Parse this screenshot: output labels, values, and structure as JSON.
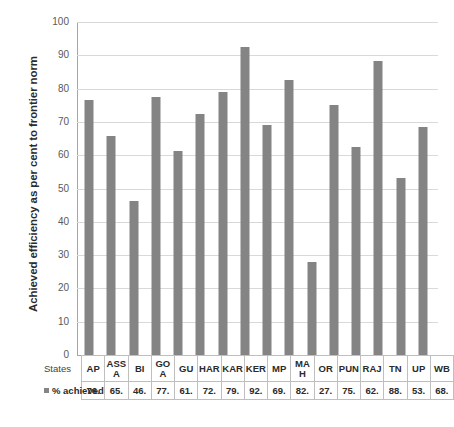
{
  "chart_data": {
    "type": "bar",
    "title": "",
    "xlabel": "States",
    "ylabel": "Achieved efficiency as per cent to frontier norm",
    "ylim": [
      0,
      100
    ],
    "ytick_step": 10,
    "yticks": [
      "100",
      "90",
      "80",
      "70",
      "60",
      "50",
      "40",
      "30",
      "20",
      "10",
      "0"
    ],
    "grid": true,
    "legend": "% achieved",
    "bar_color": "#848484",
    "gridline_color": "#d9d9d9",
    "axis_color": "#a6a6a6",
    "categories": [
      "AP",
      "ASS A",
      "BI",
      "GO A",
      "GU",
      "HAR",
      "KAR",
      "KER",
      "MP",
      "MA H",
      "OR",
      "PUN",
      "RAJ",
      "TN",
      "UP",
      "WB"
    ],
    "category_labels": [
      "AP",
      "ASS\nA",
      "BI",
      "GO\nA",
      "GU",
      "HAR",
      "KAR",
      "KER",
      "MP",
      "MA\nH",
      "OR",
      "PUN",
      "RAJ",
      "TN",
      "UP",
      "WB"
    ],
    "value_labels": [
      "76.",
      "65.",
      "46.",
      "77.",
      "61.",
      "72.",
      "79.",
      "92.",
      "69.",
      "82.",
      "27.",
      "75.",
      "62.",
      "88.",
      "53.",
      "68."
    ],
    "values": [
      76.5,
      65.7,
      46.4,
      77.5,
      61.4,
      72.4,
      79.1,
      92.5,
      69.1,
      82.6,
      27.9,
      75.2,
      62.6,
      88.3,
      53.2,
      68.6
    ]
  },
  "table": {
    "row_header_states": "States",
    "row_header_achieved": "% achieved"
  }
}
